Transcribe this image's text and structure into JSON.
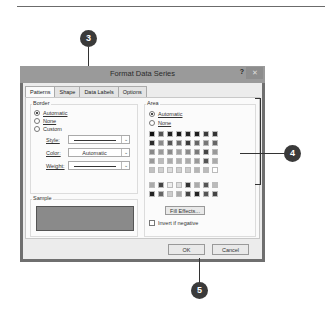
{
  "dialog": {
    "title": "Format Data Series",
    "help_label": "?",
    "close_label": "✕",
    "tabs": [
      {
        "label": "Patterns",
        "active": true
      },
      {
        "label": "Shape",
        "active": false
      },
      {
        "label": "Data Labels",
        "active": false
      },
      {
        "label": "Options",
        "active": false
      }
    ],
    "border": {
      "group_label": "Border",
      "options": [
        {
          "label": "Automatic",
          "selected": true
        },
        {
          "label": "None",
          "selected": false
        },
        {
          "label": "Custom",
          "selected": false
        }
      ],
      "style_label": "Style:",
      "color_label": "Color:",
      "color_value": "Automatic",
      "weight_label": "Weight:"
    },
    "sample": {
      "group_label": "Sample",
      "fill_color": "#8a8a8a"
    },
    "area": {
      "group_label": "Area",
      "options": [
        {
          "label": "Automatic",
          "selected": true
        },
        {
          "label": "None",
          "selected": false
        }
      ],
      "palette": [
        "#111111",
        "#555555",
        "#222222",
        "#1a1a1a",
        "#222222",
        "#1c1c1c",
        "#3a3a3a",
        "#333333",
        "#2a2a2a",
        "#8a8a8a",
        "#555555",
        "#6a6a6a",
        "#3a3a3a",
        "#666666",
        "#777777",
        "#666666",
        "#888888",
        "#9a9a9a",
        "#8a8a8a",
        "#a0a0a0",
        "#8a8a8a",
        "#7a7a7a",
        "#444444",
        "#999999",
        "#999999",
        "#bbbbbb",
        "#aaaaaa",
        "#b0b0b0",
        "#aaaaaa",
        "#999999",
        "#555555",
        "#aaaaaa",
        "#c0c0c0",
        "#cfcfcf",
        "#dddddd",
        "#d0d0d0",
        "#cccccc",
        "#b5b5b5",
        "#bbbbbb",
        "#ffffff"
      ],
      "palette2": [
        "#aaaaaa",
        "#444444",
        "#eeeeee",
        "#dddddd",
        "#333333",
        "#aaaaaa",
        "#555555",
        "#bbbbbb",
        "#222222",
        "#666666",
        "#cccccc",
        "#aaaaaa",
        "#444444",
        "#222222",
        "#555555",
        "#444444"
      ],
      "fill_effects_label": "Fill Effects...",
      "invert_label": "Invert if negative",
      "invert_checked": false
    },
    "ok_label": "OK",
    "cancel_label": "Cancel"
  },
  "callouts": {
    "tabs": "3",
    "area": "4",
    "ok": "5"
  }
}
